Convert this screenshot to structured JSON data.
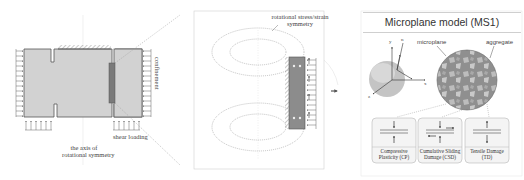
{
  "panel_left": {
    "labels": {
      "confinement": "confinement",
      "shear_loading": "shear loading",
      "axis_line1": "the axis of",
      "axis_line2": "rotational symmetry"
    }
  },
  "panel_middle": {
    "labels": {
      "symmetry_line1": "rotational stress/strain",
      "symmetry_line2": "symmetry"
    }
  },
  "panel_right": {
    "title": "Microplane model (MS1)",
    "labels": {
      "microplane": "microplane",
      "aggregate": "aggregate",
      "axis_x": "x",
      "axis_y": "y",
      "axis_z": "z",
      "axis_n": "n"
    },
    "mechanisms": [
      {
        "line1": "Compressive",
        "line2": "Plasticity (CP)"
      },
      {
        "line1": "Cumulative Sliding",
        "line2": "Damage (CSD)"
      },
      {
        "line1": "Tensile Damage",
        "line2": "(TD)"
      }
    ]
  },
  "colors": {
    "specimen_fill": "#d2d2d2",
    "shear_band": "#7a7a7a",
    "outline": "#555555",
    "dotted": "#9a9a9a"
  }
}
